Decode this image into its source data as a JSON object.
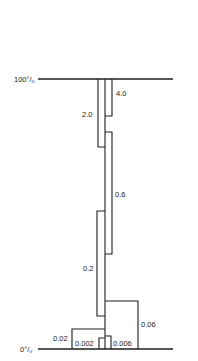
{
  "diagram": {
    "axis_labels": {
      "top": "100°/₀",
      "bottom": "0°/₀"
    },
    "segments": [
      {
        "label": "4.0",
        "side": "right"
      },
      {
        "label": "2.0",
        "side": "left"
      },
      {
        "label": "0.6",
        "side": "right"
      },
      {
        "label": "0.2",
        "side": "left"
      },
      {
        "label": "0.06",
        "side": "right"
      },
      {
        "label": "0.02",
        "side": "left"
      },
      {
        "label": "0.002",
        "side": "left-inner"
      },
      {
        "label": "0.006",
        "side": "right-inner"
      }
    ]
  }
}
